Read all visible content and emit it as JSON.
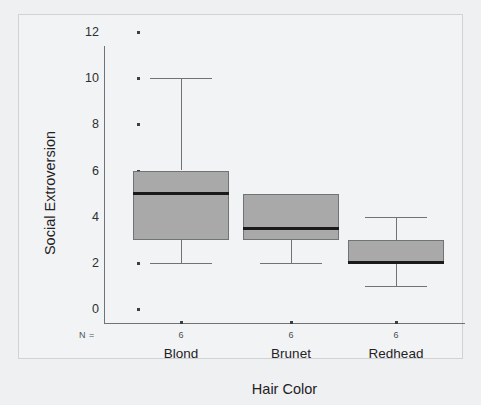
{
  "chart_data": {
    "type": "box",
    "title": "",
    "xlabel": "Hair Color",
    "ylabel": "Social Extroversion",
    "ylim": [
      0,
      12
    ],
    "yticks": [
      0,
      2,
      4,
      6,
      8,
      10,
      12
    ],
    "ytick_labels": [
      "0",
      "2",
      "4",
      "6",
      "8",
      "10",
      "12"
    ],
    "grid": false,
    "legend": "none",
    "n_label": "N =",
    "categories": [
      "Blond",
      "Brunet",
      "Redhead"
    ],
    "n_counts": [
      "6",
      "6",
      "6"
    ],
    "boxes": [
      {
        "category": "Blond",
        "n": "6",
        "whisker_low": 2,
        "q1": 3,
        "median": 5,
        "q3": 6,
        "whisker_high": 10
      },
      {
        "category": "Brunet",
        "n": "6",
        "whisker_low": 2,
        "q1": 3,
        "median": 3.5,
        "q3": 5,
        "whisker_high": 5
      },
      {
        "category": "Redhead",
        "n": "6",
        "whisker_low": 1,
        "q1": 2,
        "median": 2,
        "q3": 3,
        "whisker_high": 4
      }
    ],
    "colors": {
      "box_fill": "#a9a9a9",
      "box_edge": "#6f7577",
      "median": "#1a1a1a",
      "whisker": "#6d7376",
      "axis": "#6d7376",
      "text": "#1f2224",
      "figure_background": "#eef0f1",
      "plot_background": "#f2f3f4"
    }
  }
}
